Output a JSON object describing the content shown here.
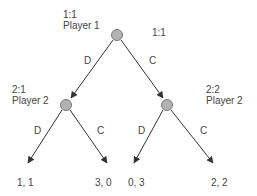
{
  "diagram": {
    "type": "extensive-form-game-tree",
    "colors": {
      "node_fill": "#b3b3b3",
      "node_stroke": "#7a7a7a",
      "edge": "#333333",
      "text": "#444444"
    },
    "nodes": {
      "root": {
        "id_label": "1:1",
        "player": "Player 1",
        "extra_label": "1:1"
      },
      "left": {
        "id_label": "2:1",
        "player": "Player 2"
      },
      "right": {
        "id_label": "2:2",
        "player": "Player 2"
      }
    },
    "edges": {
      "root_left": "D",
      "root_right": "C",
      "left_left": "D",
      "left_right": "C",
      "right_left": "D",
      "right_right": "C"
    },
    "payoffs": [
      "1, 1",
      "3, 0",
      "0, 3",
      "2, 2"
    ]
  }
}
